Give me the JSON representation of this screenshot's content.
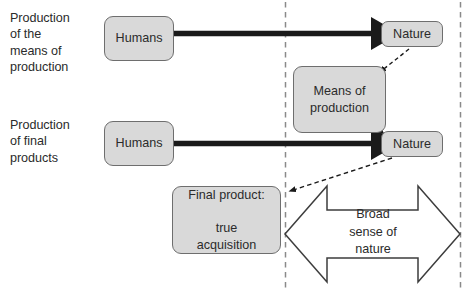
{
  "diagram": {
    "title_present": false,
    "side_labels": [
      {
        "id": "means",
        "text": "Production\nof the\nmeans of\nproduction"
      },
      {
        "id": "final",
        "text": "Production\nof final\nproducts"
      }
    ],
    "nodes": [
      {
        "id": "humans-1",
        "text": "Humans"
      },
      {
        "id": "humans-2",
        "text": "Humans"
      },
      {
        "id": "nature-1",
        "text": "Nature"
      },
      {
        "id": "nature-2",
        "text": "Nature"
      },
      {
        "id": "means-of-production",
        "text": "Means of\nproduction"
      },
      {
        "id": "final-product",
        "text": "Final product:\n\ntrue\nacquisition"
      }
    ],
    "broad_arrow_label": "Broad\nsense of\nnature",
    "colors": {
      "node_fill": "#d9d9d9",
      "node_stroke": "#6e6e6e",
      "text": "#2b2b2b",
      "thick_arrow": "#1a1a1a",
      "dashed_guide": "#7d7d7d",
      "outline_arrow_stroke": "#3d3d3d"
    },
    "connectors": [
      {
        "id": "humans1-to-nature1",
        "style": "thick-solid",
        "from": "humans-1",
        "to": "nature-1"
      },
      {
        "id": "humans2-to-nature2",
        "style": "thick-solid",
        "from": "humans-2",
        "to": "nature-2"
      },
      {
        "id": "nature1-to-means",
        "style": "dashed",
        "from": "nature-1",
        "to": "means-of-production"
      },
      {
        "id": "means-to-nature2",
        "style": "thin-solid",
        "from": "means-of-production",
        "to": "nature-2"
      },
      {
        "id": "nature2-to-final",
        "style": "dashed",
        "from": "nature-2",
        "to": "final-product"
      }
    ],
    "boundaries": [
      {
        "id": "left-boundary",
        "style": "vertical-dashed",
        "x": 285
      },
      {
        "id": "right-boundary",
        "style": "vertical-dashed",
        "x": 460
      }
    ]
  }
}
